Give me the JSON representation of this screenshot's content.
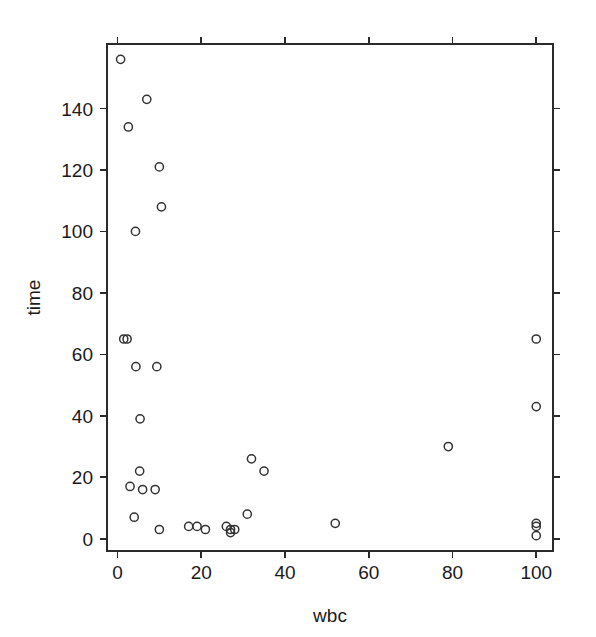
{
  "chart_data": {
    "type": "scatter",
    "title": "",
    "xlabel": "wbc",
    "ylabel": "time",
    "xlim": [
      -2.5,
      104
    ],
    "ylim": [
      -4,
      161
    ],
    "xticks": [
      0,
      20,
      40,
      60,
      80,
      100
    ],
    "yticks": [
      0,
      20,
      40,
      60,
      80,
      100,
      120,
      140
    ],
    "xticklabels": [
      "0",
      "20",
      "40",
      "60",
      "80",
      "100"
    ],
    "yticklabels": [
      "0",
      "20",
      "40",
      "60",
      "80",
      "100",
      "120",
      "140"
    ],
    "grid": false,
    "legend": null,
    "marker": "open-circle",
    "marker_color": "#333333",
    "frame": "box",
    "tick_direction": "out",
    "points": [
      {
        "x": 2.3,
        "y": 65
      },
      {
        "x": 0.75,
        "y": 156
      },
      {
        "x": 4.3,
        "y": 100
      },
      {
        "x": 2.6,
        "y": 134
      },
      {
        "x": 6.0,
        "y": 16
      },
      {
        "x": 10.5,
        "y": 108
      },
      {
        "x": 10.0,
        "y": 121
      },
      {
        "x": 17.0,
        "y": 4
      },
      {
        "x": 5.4,
        "y": 39
      },
      {
        "x": 7.0,
        "y": 143
      },
      {
        "x": 9.4,
        "y": 56
      },
      {
        "x": 32.0,
        "y": 26
      },
      {
        "x": 35.0,
        "y": 22
      },
      {
        "x": 100.0,
        "y": 1
      },
      {
        "x": 100.0,
        "y": 5
      },
      {
        "x": 52.0,
        "y": 5
      },
      {
        "x": 100.0,
        "y": 65
      },
      {
        "x": 4.4,
        "y": 56
      },
      {
        "x": 3.0,
        "y": 17
      },
      {
        "x": 4.0,
        "y": 7
      },
      {
        "x": 1.5,
        "y": 65
      },
      {
        "x": 9.0,
        "y": 16
      },
      {
        "x": 5.3,
        "y": 22
      },
      {
        "x": 10.0,
        "y": 3
      },
      {
        "x": 19.0,
        "y": 4
      },
      {
        "x": 27.0,
        "y": 2
      },
      {
        "x": 28.0,
        "y": 3
      },
      {
        "x": 31.0,
        "y": 8
      },
      {
        "x": 26.0,
        "y": 4
      },
      {
        "x": 21.0,
        "y": 3
      },
      {
        "x": 79.0,
        "y": 30
      },
      {
        "x": 100.0,
        "y": 43
      },
      {
        "x": 100.0,
        "y": 4
      },
      {
        "x": 27.0,
        "y": 3
      }
    ]
  },
  "geometry": {
    "plot_left": 107,
    "plot_right": 553,
    "plot_top": 44,
    "plot_bottom": 551,
    "tick_len": 7
  }
}
